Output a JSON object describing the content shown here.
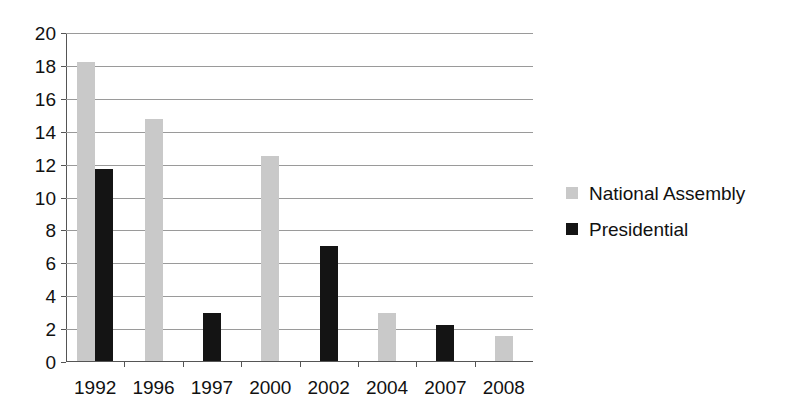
{
  "chart_data": {
    "type": "bar",
    "title": "",
    "xlabel": "",
    "ylabel": "",
    "categories": [
      "1992",
      "1996",
      "1997",
      "2000",
      "2002",
      "2004",
      "2007",
      "2008"
    ],
    "series": [
      {
        "name": "National Assembly",
        "color": "#c9c9c9",
        "values": [
          18.2,
          14.7,
          null,
          12.45,
          null,
          2.9,
          null,
          1.5
        ]
      },
      {
        "name": "Presidential",
        "color": "#141414",
        "values": [
          11.7,
          null,
          2.9,
          null,
          7.0,
          null,
          2.2,
          null
        ]
      }
    ],
    "ylim": [
      0,
      20
    ],
    "ytick_labels": [
      "0",
      "2",
      "4",
      "6",
      "8",
      "10",
      "12",
      "14",
      "16",
      "18",
      "20"
    ],
    "ytick_values": [
      0,
      2,
      4,
      6,
      8,
      10,
      12,
      14,
      16,
      18,
      20
    ],
    "grid": true,
    "legend_position": "right"
  },
  "legend": {
    "entries": [
      {
        "label": "National Assembly",
        "swatch": "national"
      },
      {
        "label": "Presidential",
        "swatch": "presidential"
      }
    ]
  }
}
